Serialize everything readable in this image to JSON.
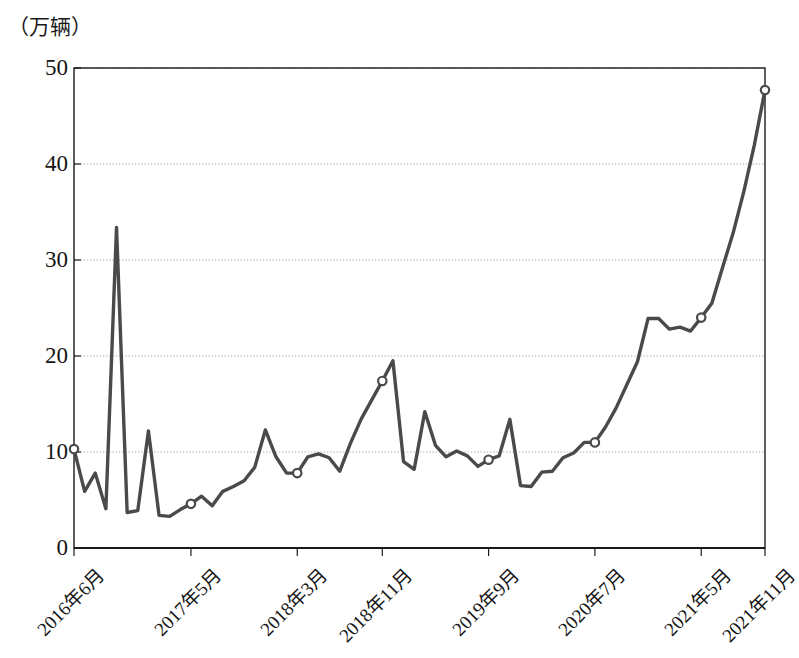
{
  "chart_data": {
    "type": "line",
    "title": "",
    "subtitle": "",
    "ylabel": "（万辆）",
    "xlabel": "",
    "ylim": [
      0,
      50
    ],
    "yticks": [
      0,
      10,
      20,
      30,
      40,
      50
    ],
    "ytick_labels": [
      "0",
      "10",
      "20",
      "30",
      "40",
      "50"
    ],
    "grid": "horizontal",
    "legend": "none",
    "marker_style": "open-circle",
    "line_color": "#4a4a4a",
    "grid_color": "#b5b5b5",
    "axis_color": "#1a1a1a",
    "xtick_labels": [
      "2016年6月",
      "2017年5月",
      "2018年3月",
      "2018年11月",
      "2019年9月",
      "2020年7月",
      "2021年5月",
      "2021年11月"
    ],
    "xtick_indices": [
      0,
      11,
      21,
      29,
      39,
      49,
      59,
      65
    ],
    "marked_points": [
      {
        "label": "2016年6月",
        "index": 0,
        "value": 10.3
      },
      {
        "label": "2017年5月",
        "index": 11,
        "value": 4.6
      },
      {
        "label": "2018年3月",
        "index": 21,
        "value": 7.8
      },
      {
        "label": "2018年11月",
        "index": 29,
        "value": 17.4
      },
      {
        "label": "2019年9月",
        "index": 39,
        "value": 9.2
      },
      {
        "label": "2020年7月",
        "index": 49,
        "value": 11.0
      },
      {
        "label": "2021年5月",
        "index": 59,
        "value": 24.0
      },
      {
        "label": "2021年11月",
        "index": 65,
        "value": 47.7
      }
    ],
    "categories": [
      "2016年6月",
      "2016年7月",
      "2016年8月",
      "2016年9月",
      "2016年10月",
      "2016年11月",
      "2016年12月",
      "2017年1月",
      "2017年2月",
      "2017年3月",
      "2017年4月",
      "2017年5月",
      "2017年6月",
      "2017年7月",
      "2017年8月",
      "2017年9月",
      "2017年10月",
      "2017年11月",
      "2017年12月",
      "2018年1月",
      "2018年2月",
      "2018年3月",
      "2018年4月",
      "2018年5月",
      "2018年6月",
      "2018年7月",
      "2018年8月",
      "2018年9月",
      "2018年10月",
      "2018年11月",
      "2018年12月",
      "2019年1月",
      "2019年2月",
      "2019年3月",
      "2019年4月",
      "2019年5月",
      "2019年6月",
      "2019年7月",
      "2019年8月",
      "2019年9月",
      "2019年10月",
      "2019年11月",
      "2019年12月",
      "2020年1月",
      "2020年2月",
      "2020年3月",
      "2020年4月",
      "2020年5月",
      "2020年6月",
      "2020年7月",
      "2020年8月",
      "2020年9月",
      "2020年10月",
      "2020年11月",
      "2020年12月",
      "2021年1月",
      "2021年2月",
      "2021年3月",
      "2021年4月",
      "2021年5月",
      "2021年6月",
      "2021年7月",
      "2021年8月",
      "2021年9月",
      "2021年10月",
      "2021年11月"
    ],
    "values": [
      10.3,
      5.9,
      7.8,
      4.1,
      33.4,
      3.7,
      3.9,
      12.2,
      3.4,
      3.3,
      4.0,
      4.6,
      5.4,
      4.4,
      5.9,
      6.4,
      7.0,
      8.4,
      12.3,
      9.5,
      7.8,
      7.8,
      9.5,
      9.8,
      9.4,
      8.0,
      10.9,
      13.4,
      15.4,
      17.4,
      19.5,
      9.0,
      8.2,
      14.2,
      10.7,
      9.5,
      10.1,
      9.6,
      8.5,
      9.2,
      9.6,
      13.4,
      6.5,
      6.4,
      7.9,
      8.0,
      9.4,
      9.9,
      11.0,
      11.0,
      12.6,
      14.6,
      17.0,
      19.4,
      23.9,
      23.9,
      22.8,
      23.0,
      22.6,
      24.0,
      25.5,
      29.2,
      32.8,
      37.1,
      42.0,
      47.7
    ]
  }
}
